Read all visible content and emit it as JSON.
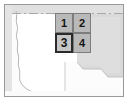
{
  "thumbnail": {
    "title": "Map tile selection thumbnail",
    "width": 128,
    "height": 101
  },
  "map": {
    "background_color": "#fbfbfb",
    "land_color": "#ffffff",
    "shaded_region_color": "#d7d7d7",
    "secondary_shade_color": "#e3e3e3",
    "coastline_color": "#b0b0b0",
    "border_color": "#9a9a9a",
    "regions": [
      {
        "name": "west-coast-landmass",
        "fill": "#ffffff"
      },
      {
        "name": "east-shaded-area",
        "fill": "#d9d9d9"
      },
      {
        "name": "north-strip",
        "fill": "#e6e6e6"
      }
    ]
  },
  "grid": {
    "name": "tile-grid",
    "columns": 2,
    "rows": 2,
    "selected_index": 2,
    "selected_label": "3",
    "cell_fill": "#b9b9b9",
    "cell_border": "#7d7d7d",
    "selected_border": "#2b2b2b",
    "selected_fill": "#c6c6c6",
    "cells": [
      {
        "label": "1",
        "name": "grid-cell-1",
        "selected": false
      },
      {
        "label": "2",
        "name": "grid-cell-2",
        "selected": false
      },
      {
        "label": "3",
        "name": "grid-cell-3",
        "selected": true
      },
      {
        "label": "4",
        "name": "grid-cell-4",
        "selected": false
      }
    ]
  }
}
